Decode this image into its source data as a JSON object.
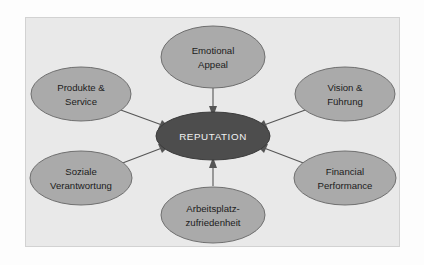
{
  "diagram": {
    "frame": {
      "background_color": "#e9e9e9",
      "border_color": "#d2d2d2"
    },
    "hub": {
      "label": "REPUTATION",
      "fill_color": "#4d4d4d",
      "text_color": "#f2f2f2"
    },
    "node_style": {
      "fill_color": "#aaaaaa",
      "stroke_color": "#6f6f6f",
      "text_color": "#1c1c1c"
    },
    "arrow_color": "#555555",
    "nodes": [
      {
        "id": "emotional-appeal",
        "line1": "Emotional",
        "line2": "Appeal",
        "position": "top"
      },
      {
        "id": "produkte-service",
        "line1": "Produkte &",
        "line2": "Service",
        "position": "upper-left"
      },
      {
        "id": "soziale-verantwortung",
        "line1": "Soziale",
        "line2": "Verantwortung",
        "position": "lower-left"
      },
      {
        "id": "vision-fuehrung",
        "line1": "Vision &",
        "line2": "Führung",
        "position": "upper-right"
      },
      {
        "id": "financial-performance",
        "line1": "Financial",
        "line2": "Performance",
        "position": "lower-right"
      },
      {
        "id": "arbeitsplatzzufriedenheit",
        "line1": "Arbeitsplatz-",
        "line2": "zufriedenheit",
        "position": "bottom"
      }
    ]
  }
}
